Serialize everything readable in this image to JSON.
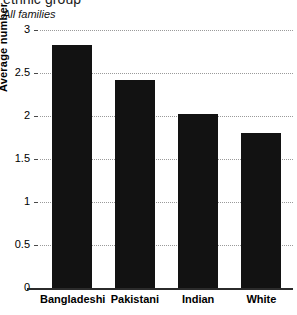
{
  "chart_data": {
    "type": "bar",
    "title": "ethnic group",
    "subtitle": "All families",
    "categories": [
      "Bangladeshi",
      "Pakistani",
      "Indian",
      "White"
    ],
    "values": [
      2.82,
      2.42,
      2.02,
      1.8
    ],
    "xlabel": "",
    "ylabel": "Average number of children",
    "ylim": [
      0,
      3
    ],
    "ytick_labels": [
      "3",
      "2.5",
      "2",
      "1.5",
      "1",
      "0.5",
      "0"
    ],
    "ytick_values": [
      3,
      2.5,
      2,
      1.5,
      1,
      0.5,
      0
    ],
    "grid": true,
    "legend": null,
    "bar_color": "#121212",
    "gridline_color": "#9a9a9a",
    "background_color": "#ffffff"
  }
}
